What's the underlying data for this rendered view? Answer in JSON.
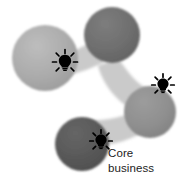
{
  "diagram": {
    "type": "node-network",
    "caption": {
      "line1": "Core",
      "line2": "business",
      "full_text": "Core business",
      "color": "#1c1c1c"
    },
    "background_color": "#ffffff",
    "connector_color": "#c9c9c9",
    "nodes": [
      {
        "id": "node-left",
        "label": "",
        "cx": 45,
        "cy": 58,
        "r": 33,
        "fill": "#a8a8a8",
        "shade": "light-gray"
      },
      {
        "id": "node-top-right",
        "label": "",
        "cx": 112,
        "cy": 35,
        "r": 28,
        "fill": "#6d6d6d",
        "shade": "dark-gray"
      },
      {
        "id": "node-right",
        "label": "",
        "cx": 150,
        "cy": 112,
        "r": 26,
        "fill": "#8f8f8f",
        "shade": "medium-gray"
      },
      {
        "id": "node-bottom",
        "label": "",
        "cx": 82,
        "cy": 144,
        "r": 27,
        "fill": "#5a5a5a",
        "shade": "darkest-gray"
      }
    ],
    "connectors": [
      {
        "id": "connector-left-topright",
        "from": "node-left",
        "to": "node-top-right"
      },
      {
        "id": "connector-topright-right",
        "from": "node-top-right",
        "to": "node-right"
      },
      {
        "id": "connector-right-bottom",
        "from": "node-right",
        "to": "node-bottom"
      }
    ],
    "lightbulbs": [
      {
        "id": "lightbulb-left",
        "cx": 65,
        "cy": 62,
        "scale": 1.0,
        "color": "#000000"
      },
      {
        "id": "lightbulb-right",
        "cx": 163,
        "cy": 85,
        "scale": 0.9,
        "color": "#000000"
      },
      {
        "id": "lightbulb-bottom",
        "cx": 101,
        "cy": 141,
        "scale": 0.9,
        "color": "#000000"
      }
    ]
  }
}
